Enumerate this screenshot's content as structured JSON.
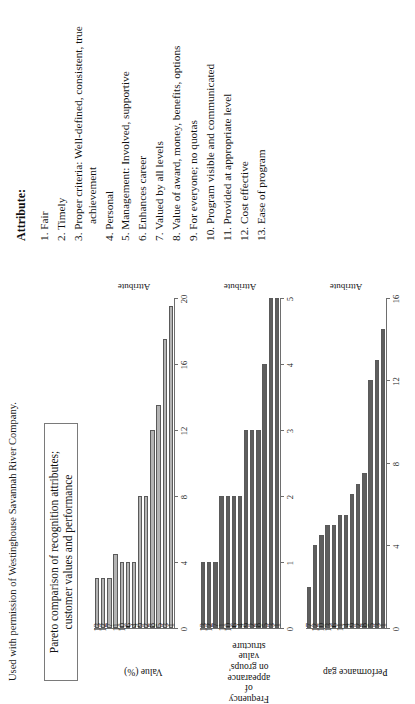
{
  "caption": "Used with permission of Westinghouse Savannah River Company.",
  "title_box": "Pareto comparison of recognition attributes; customer values and performance",
  "attributes": {
    "heading": "Attribute:",
    "items": [
      "1. Fair",
      "2. Timely",
      "3. Proper criteria: Well-defined, consistent, true achievement",
      "4. Personal",
      "5. Management: Involved, supportive",
      "6. Enhances career",
      "7. Valued by all levels",
      "8. Value of award, money, benefits, options",
      "9. For everyone; no quotas",
      "10. Program visible and communicated",
      "11. Provided at appropriate level",
      "12. Cost effective",
      "13. Ease of program"
    ]
  },
  "chart_data": [
    {
      "type": "bar",
      "orientation": "horizontal",
      "title": "",
      "ylabel": "Value (%)",
      "xlabel": "Attribute",
      "categories": [
        "1",
        "3",
        "5",
        "8",
        "2",
        "9",
        "4",
        "6",
        "10",
        "11",
        "7",
        "12",
        "13"
      ],
      "values": [
        19.5,
        17.5,
        13.5,
        12.0,
        8.0,
        8.0,
        4.0,
        4.0,
        4.0,
        4.5,
        3.0,
        3.0,
        3.0
      ],
      "ylim": [
        0,
        20
      ],
      "yticks": [
        0,
        4,
        8,
        12,
        16,
        20
      ],
      "bar_color": "#b4b4b4",
      "grid": false
    },
    {
      "type": "bar",
      "orientation": "horizontal",
      "title": "",
      "ylabel": "Frequency of appearance on groups' value structure",
      "xlabel": "Attribute",
      "categories": [
        "1",
        "3",
        "5",
        "8",
        "2",
        "9",
        "4",
        "6",
        "10",
        "11",
        "7",
        "12",
        "13"
      ],
      "values": [
        5.0,
        5.0,
        4.0,
        3.0,
        3.0,
        3.0,
        2.0,
        2.0,
        2.0,
        2.0,
        1.0,
        1.0,
        1.0
      ],
      "ylim": [
        0,
        5
      ],
      "yticks": [
        0,
        1,
        2,
        3,
        4,
        5
      ],
      "bar_color": "#5e5e5e",
      "grid": false
    },
    {
      "type": "bar",
      "orientation": "horizontal",
      "title": "",
      "ylabel": "Performance gap",
      "xlabel": "Attribute",
      "categories": [
        "1",
        "3",
        "5",
        "8",
        "2",
        "9",
        "4",
        "11",
        "6",
        "13",
        "10",
        "12",
        "7"
      ],
      "values": [
        14.5,
        13.0,
        12.0,
        7.5,
        7.0,
        6.5,
        5.5,
        5.5,
        5.0,
        5.0,
        4.5,
        4.0,
        2.0
      ],
      "ylim": [
        0,
        16
      ],
      "yticks": [
        0,
        4,
        8,
        12,
        16
      ],
      "bar_color": "#5e5e5e",
      "grid": false
    }
  ]
}
